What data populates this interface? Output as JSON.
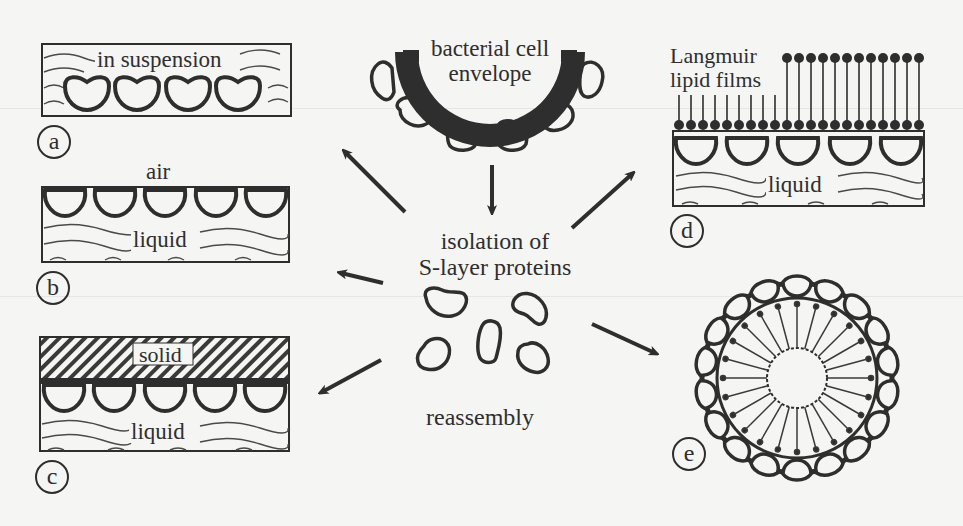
{
  "figure": {
    "center": {
      "source_label": "bacterial cell envelope",
      "source_label_line1": "bacterial cell",
      "source_label_line2": "envelope",
      "isolation_label_line1": "isolation of",
      "isolation_label_line2": "S-layer proteins",
      "reassembly_label": "reassembly"
    },
    "panels": [
      {
        "id": "a",
        "badge": "a",
        "label": "in suspension"
      },
      {
        "id": "b",
        "badge": "b",
        "top_label": "air",
        "label": "liquid"
      },
      {
        "id": "c",
        "badge": "c",
        "top_label": "solid",
        "label": "liquid"
      },
      {
        "id": "d",
        "badge": "d",
        "top_label_line1": "Langmuir",
        "top_label_line2": "lipid films",
        "label": "liquid"
      },
      {
        "id": "e",
        "badge": "e"
      }
    ],
    "colors": {
      "ink": "#2e2e2e",
      "paper": "#f5f5f3",
      "hatch": "#3a3a3a"
    }
  }
}
